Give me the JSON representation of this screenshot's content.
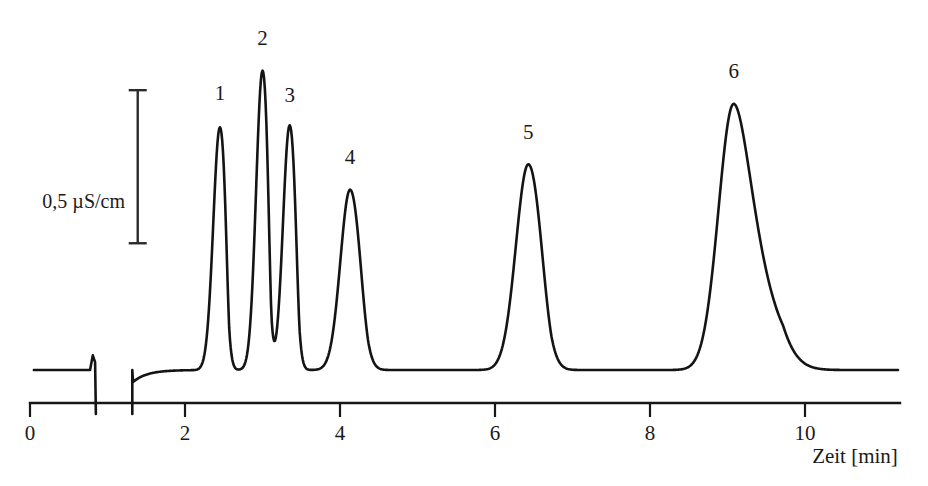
{
  "figure": {
    "background_color": "#ffffff",
    "trace_color": "#141414",
    "axis_color": "#171717",
    "text_color": "#1a1a1a"
  },
  "chart_data": {
    "type": "line",
    "title": "",
    "subtitle": "",
    "xlabel": "Zeit [min]",
    "ylabel": "",
    "xlim": [
      0,
      11.2
    ],
    "ylim": [
      0,
      1.75
    ],
    "grid": false,
    "legend": null,
    "x_ticks": [
      0,
      2,
      4,
      6,
      8,
      10
    ],
    "x_tick_labels": [
      "0",
      "2",
      "4",
      "6",
      "8",
      "10"
    ],
    "y_axis_shown": false,
    "scale_bar": {
      "label": "0,5 µS/cm",
      "value": 0.5,
      "unit": "µS/cm",
      "x_position_min": 1.39,
      "y_top": 1.5,
      "y_bottom": 0.715
    },
    "baseline_level": 0.065,
    "injection_dip": {
      "x": 0.83,
      "depth": -0.16,
      "description": "system/injection peak dip before first analyte"
    },
    "baseline_start_x": 0.05,
    "baseline_rise_x": 1.32,
    "series_name": "Leitfähigkeit",
    "peaks": [
      {
        "label": "1",
        "x": 2.45,
        "height": 1.245,
        "width": 0.085,
        "tail": 0.055,
        "label_x": 2.45,
        "label_y": 1.45
      },
      {
        "label": "2",
        "x": 3.0,
        "height": 1.535,
        "width": 0.082,
        "tail": 0.052,
        "label_x": 3.0,
        "label_y": 1.73
      },
      {
        "label": "3",
        "x": 3.35,
        "height": 1.255,
        "width": 0.085,
        "tail": 0.058,
        "label_x": 3.35,
        "label_y": 1.44
      },
      {
        "label": "4",
        "x": 4.13,
        "height": 0.925,
        "width": 0.125,
        "tail": 0.105,
        "label_x": 4.13,
        "label_y": 1.12
      },
      {
        "label": "5",
        "x": 6.43,
        "height": 1.055,
        "width": 0.16,
        "tail": 0.135,
        "label_x": 6.43,
        "label_y": 1.25
      },
      {
        "label": "6",
        "x": 9.08,
        "height": 1.365,
        "width": 0.195,
        "tail": 0.29,
        "label_x": 9.08,
        "label_y": 1.56
      }
    ]
  }
}
